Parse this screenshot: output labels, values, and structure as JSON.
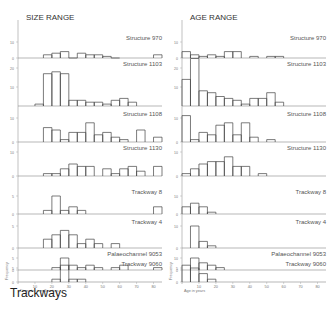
{
  "caption": "Trackways",
  "chart_data": [
    {
      "type": "bar",
      "title": "SIZE RANGE",
      "xlabel": "Diameter in millimetres",
      "ylabel": "Frequency",
      "x_ticks": [
        10,
        20,
        30,
        40,
        50,
        60,
        70,
        80
      ],
      "xlim": [
        0,
        85
      ],
      "bin_width": 5,
      "panels": [
        {
          "label": "Structure 970",
          "ymax": 10,
          "y_ticks": [
            0,
            10
          ],
          "bins": [
            [
              15,
              2
            ],
            [
              20,
              3
            ],
            [
              25,
              4
            ],
            [
              30,
              0
            ],
            [
              35,
              3
            ],
            [
              40,
              2
            ],
            [
              45,
              2
            ],
            [
              50,
              1
            ],
            [
              55,
              0
            ],
            [
              80,
              2
            ]
          ]
        },
        {
          "label": "Structure 1103",
          "ymax": 20,
          "y_ticks": [
            10,
            20
          ],
          "bins": [
            [
              10,
              1
            ],
            [
              15,
              17
            ],
            [
              20,
              18
            ],
            [
              25,
              17
            ],
            [
              30,
              3
            ],
            [
              35,
              3
            ],
            [
              40,
              2
            ],
            [
              45,
              2
            ],
            [
              50,
              1
            ],
            [
              55,
              3
            ],
            [
              60,
              4
            ],
            [
              65,
              2
            ]
          ]
        },
        {
          "label": "Structure 1108",
          "ymax": 10,
          "y_ticks": [
            0,
            10
          ],
          "bins": [
            [
              15,
              6
            ],
            [
              20,
              5
            ],
            [
              25,
              1
            ],
            [
              30,
              4
            ],
            [
              35,
              4
            ],
            [
              40,
              8
            ],
            [
              45,
              3
            ],
            [
              50,
              4
            ],
            [
              55,
              2
            ],
            [
              60,
              1
            ],
            [
              70,
              5
            ],
            [
              80,
              2
            ]
          ]
        },
        {
          "label": "Structure 1130",
          "ymax": 10,
          "y_ticks": [
            0,
            10
          ],
          "bins": [
            [
              15,
              1
            ],
            [
              20,
              1
            ],
            [
              25,
              3
            ],
            [
              30,
              5
            ],
            [
              35,
              4
            ],
            [
              40,
              4
            ],
            [
              50,
              3
            ],
            [
              55,
              1
            ],
            [
              60,
              3
            ],
            [
              65,
              4
            ],
            [
              70,
              2
            ],
            [
              80,
              4
            ]
          ]
        },
        {
          "label": "Trackway 8",
          "ymax": 5,
          "y_ticks": [
            0,
            5
          ],
          "bins": [
            [
              15,
              1
            ],
            [
              20,
              5
            ],
            [
              25,
              1
            ],
            [
              30,
              2
            ],
            [
              35,
              1
            ],
            [
              80,
              2
            ]
          ]
        },
        {
          "label": "Trackway 4",
          "ymax": 5,
          "y_ticks": [
            0,
            5
          ],
          "bins": [
            [
              15,
              2
            ],
            [
              20,
              3
            ],
            [
              25,
              4
            ],
            [
              30,
              3
            ],
            [
              35,
              1
            ],
            [
              40,
              2
            ],
            [
              45,
              1
            ],
            [
              55,
              1
            ]
          ]
        },
        {
          "label": "Palaeochannel 9053",
          "ymax": 5,
          "y_ticks": [
            0,
            5
          ],
          "bins": [
            [
              20,
              1
            ],
            [
              25,
              5
            ],
            [
              30,
              2
            ],
            [
              35,
              1
            ],
            [
              40,
              2
            ],
            [
              45,
              1
            ],
            [
              55,
              1
            ],
            [
              60,
              2
            ],
            [
              80,
              1
            ]
          ]
        },
        {
          "label": "Trackway 9060",
          "ymax": 5,
          "y_ticks": [
            0,
            5
          ],
          "bins": [
            [
              20,
              1
            ],
            [
              25,
              6
            ],
            [
              30,
              1
            ],
            [
              35,
              1
            ]
          ]
        }
      ]
    },
    {
      "type": "bar",
      "title": "AGE RANGE",
      "xlabel": "Age in years",
      "ylabel": "Frequency",
      "x_ticks": [
        10,
        20,
        30,
        40,
        50,
        60,
        70,
        80
      ],
      "xlim": [
        0,
        85
      ],
      "bin_width": 5,
      "panels": [
        {
          "label": "Structure 970",
          "ymax": 10,
          "y_ticks": [
            0,
            10
          ],
          "bins": [
            [
              0,
              4
            ],
            [
              5,
              2
            ],
            [
              10,
              1
            ],
            [
              15,
              2
            ],
            [
              20,
              1
            ],
            [
              25,
              4
            ],
            [
              30,
              4
            ],
            [
              40,
              1
            ],
            [
              50,
              1
            ],
            [
              55,
              1
            ]
          ]
        },
        {
          "label": "Structure 1103",
          "ymax": 20,
          "y_ticks": [
            10,
            20
          ],
          "bins": [
            [
              0,
              14
            ],
            [
              5,
              25
            ],
            [
              10,
              8
            ],
            [
              15,
              7
            ],
            [
              20,
              5
            ],
            [
              25,
              4
            ],
            [
              30,
              3
            ],
            [
              35,
              1
            ],
            [
              40,
              4
            ],
            [
              45,
              4
            ],
            [
              50,
              7
            ],
            [
              55,
              2
            ]
          ]
        },
        {
          "label": "Structure 1108",
          "ymax": 10,
          "y_ticks": [
            0,
            10
          ],
          "bins": [
            [
              0,
              11
            ],
            [
              5,
              1
            ],
            [
              10,
              4
            ],
            [
              15,
              3
            ],
            [
              20,
              7
            ],
            [
              25,
              8
            ],
            [
              30,
              3
            ],
            [
              35,
              8
            ],
            [
              40,
              2
            ],
            [
              50,
              1
            ]
          ]
        },
        {
          "label": "Structure 1130",
          "ymax": 10,
          "y_ticks": [
            0,
            10
          ],
          "bins": [
            [
              0,
              1
            ],
            [
              5,
              3
            ],
            [
              10,
              5
            ],
            [
              15,
              6
            ],
            [
              20,
              6
            ],
            [
              25,
              8
            ],
            [
              30,
              4
            ],
            [
              35,
              4
            ],
            [
              45,
              1
            ]
          ]
        },
        {
          "label": "Trackway 8",
          "ymax": 10,
          "y_ticks": [
            0,
            10
          ],
          "bins": [
            [
              0,
              4
            ],
            [
              5,
              6
            ],
            [
              10,
              4
            ],
            [
              15,
              1
            ]
          ]
        },
        {
          "label": "Trackway 4",
          "ymax": 10,
          "y_ticks": [
            0,
            10
          ],
          "bins": [
            [
              5,
              10
            ],
            [
              10,
              3
            ],
            [
              15,
              1
            ]
          ]
        },
        {
          "label": "Palaeochannel 9053",
          "ymax": 10,
          "y_ticks": [
            0,
            10
          ],
          "bins": [
            [
              5,
              10
            ],
            [
              10,
              6
            ],
            [
              15,
              4
            ],
            [
              20,
              2
            ]
          ]
        },
        {
          "label": "Trackway 9060",
          "ymax": 5,
          "y_ticks": [
            0,
            5
          ],
          "bins": [
            [
              0,
              6
            ],
            [
              5,
              5
            ],
            [
              10,
              3
            ],
            [
              15,
              1
            ]
          ]
        }
      ]
    }
  ]
}
